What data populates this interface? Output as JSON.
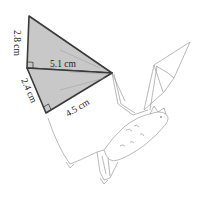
{
  "diagram": {
    "shapes": {
      "upper_triangle": {
        "legs": [
          {
            "label": "2.8 cm",
            "side": "vertical-left"
          },
          {
            "label": "5.1 cm",
            "side": "horizontal-middle"
          }
        ],
        "right_angle": true
      },
      "lower_triangle": {
        "legs": [
          {
            "label": "2.4 cm",
            "side": "lower-left"
          },
          {
            "label": "4.5 cm",
            "side": "bottom"
          }
        ],
        "right_angle": true
      }
    },
    "labels": {
      "top_left_leg": "2.8 cm",
      "middle_leg": "5.1 cm",
      "lower_left_leg": "2.4 cm",
      "bottom_leg": "4.5 cm"
    },
    "colors": {
      "fill": "#c8c8c8",
      "stroke": "#3a3a3a",
      "sketch": "#8a8a8a"
    }
  }
}
